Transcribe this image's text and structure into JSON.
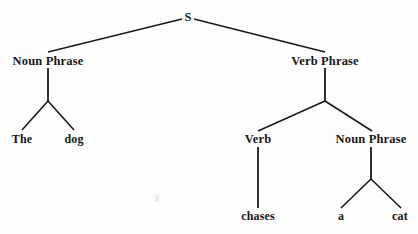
{
  "figure": {
    "background_color": "#fdfdfb",
    "ink_color": "#1a1a1c",
    "width": 418,
    "height": 234
  },
  "tree": {
    "sentence": "The dog chases a cat",
    "nodes": [
      {
        "id": "s",
        "label": "S",
        "x": 188,
        "y": 17,
        "level": "root",
        "kind": "category"
      },
      {
        "id": "np1",
        "label": "Noun Phrase",
        "x": 48,
        "y": 61,
        "level": "phrase",
        "kind": "category"
      },
      {
        "id": "vp",
        "label": "Verb Phrase",
        "x": 325,
        "y": 61,
        "level": "phrase",
        "kind": "category"
      },
      {
        "id": "the",
        "label": "The",
        "x": 22,
        "y": 139,
        "level": "leaf",
        "kind": "word"
      },
      {
        "id": "dog",
        "label": "dog",
        "x": 74,
        "y": 139,
        "level": "leaf",
        "kind": "word"
      },
      {
        "id": "verb",
        "label": "Verb",
        "x": 258,
        "y": 139,
        "level": "phrase",
        "kind": "category"
      },
      {
        "id": "np2",
        "label": "Noun Phrase",
        "x": 371,
        "y": 139,
        "level": "phrase",
        "kind": "category"
      },
      {
        "id": "chases",
        "label": "chases",
        "x": 258,
        "y": 216,
        "level": "leaf",
        "kind": "word"
      },
      {
        "id": "a",
        "label": "a",
        "x": 341,
        "y": 216,
        "level": "leaf",
        "kind": "word"
      },
      {
        "id": "cat",
        "label": "cat",
        "x": 400,
        "y": 216,
        "level": "leaf",
        "kind": "word"
      }
    ],
    "edges": [
      {
        "id": "s-np1",
        "from": "S",
        "to": "Noun Phrase",
        "x1": 182,
        "y1": 19,
        "x2": 48,
        "y2": 52,
        "width": 1.6
      },
      {
        "id": "s-vp",
        "from": "S",
        "to": "Verb Phrase",
        "x1": 194,
        "y1": 19,
        "x2": 325,
        "y2": 52,
        "width": 1.6
      },
      {
        "id": "np1-stem",
        "from": "Noun Phrase",
        "to": "fork",
        "x1": 48,
        "y1": 68,
        "x2": 48,
        "y2": 101,
        "width": 1.8
      },
      {
        "id": "np1-the",
        "from": "fork",
        "to": "The",
        "x1": 48,
        "y1": 101,
        "x2": 22,
        "y2": 130,
        "width": 1.6
      },
      {
        "id": "np1-dog",
        "from": "fork",
        "to": "dog",
        "x1": 48,
        "y1": 101,
        "x2": 74,
        "y2": 130,
        "width": 1.6
      },
      {
        "id": "vp-stem",
        "from": "Verb Phrase",
        "to": "fork",
        "x1": 325,
        "y1": 68,
        "x2": 325,
        "y2": 101,
        "width": 1.8
      },
      {
        "id": "vp-verb",
        "from": "fork",
        "to": "Verb",
        "x1": 325,
        "y1": 101,
        "x2": 258,
        "y2": 131,
        "width": 1.6
      },
      {
        "id": "vp-np2",
        "from": "fork",
        "to": "Noun Phrase",
        "x1": 325,
        "y1": 101,
        "x2": 372,
        "y2": 131,
        "width": 1.6
      },
      {
        "id": "verb-chases",
        "from": "Verb",
        "to": "chases",
        "x1": 258,
        "y1": 147,
        "x2": 258,
        "y2": 208,
        "width": 1.8
      },
      {
        "id": "np2-stem",
        "from": "Noun Phrase",
        "to": "fork",
        "x1": 371,
        "y1": 147,
        "x2": 371,
        "y2": 179,
        "width": 1.8
      },
      {
        "id": "np2-a",
        "from": "fork",
        "to": "a",
        "x1": 371,
        "y1": 179,
        "x2": 341,
        "y2": 208,
        "width": 1.6
      },
      {
        "id": "np2-cat",
        "from": "fork",
        "to": "cat",
        "x1": 371,
        "y1": 179,
        "x2": 401,
        "y2": 208,
        "width": 1.6
      }
    ]
  },
  "artifacts": [
    {
      "id": "speck-1",
      "x": 155,
      "y": 195
    }
  ]
}
